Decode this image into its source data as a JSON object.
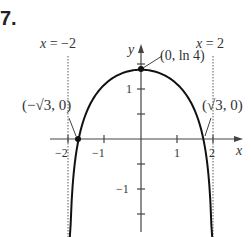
{
  "problem_number": "7.",
  "chart_data": {
    "type": "line",
    "function": "y = ln(4 - x^2)",
    "domain": [
      -2,
      2
    ],
    "xlabel": "x",
    "ylabel": "y",
    "x_ticks": [
      -2,
      -1,
      1,
      2
    ],
    "x_tick_labels": [
      "−2",
      "−1",
      "1",
      "2"
    ],
    "y_ticks": [
      -1.5,
      -1,
      -0.5,
      0.5,
      1,
      1.5
    ],
    "y_tick_labels": [
      "−1",
      "1"
    ],
    "xlim": [
      -2.8,
      2.8
    ],
    "ylim": [
      -2,
      2.3
    ],
    "asymptotes": [
      {
        "label": "x = −2",
        "x": -2,
        "style": "dotted"
      },
      {
        "label": "x = 2",
        "x": 2,
        "style": "dotted"
      }
    ],
    "points": [
      {
        "label": "(0, ln 4)",
        "x": 0,
        "y": 1.386
      },
      {
        "label": "(−√3, 0)",
        "x": -1.732,
        "y": 0
      },
      {
        "label": "(√3, 0)",
        "x": 1.732,
        "y": 0
      }
    ],
    "grid": false
  },
  "labels": {
    "asym_left": "x = −2",
    "asym_right": "x = 2",
    "peak": "(0, ln 4)",
    "root_left": "(−√3, 0)",
    "root_right": "(√3, 0)",
    "x_axis": "x",
    "y_axis": "y",
    "tick_xm2": "−2",
    "tick_xm1": "−1",
    "tick_x1": "1",
    "tick_x2": "2",
    "tick_y1": "1",
    "tick_ym1": "−1"
  }
}
